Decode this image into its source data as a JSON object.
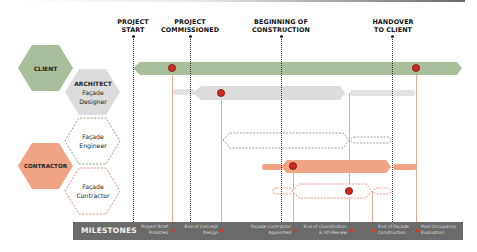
{
  "diagram": {
    "type": "stakeholder-timeline",
    "colors": {
      "client": "#a9bf9c",
      "architect": "#dcdcdc",
      "contractor": "#f0a483",
      "engineer_outline": "#6f8a5f",
      "contractor_outline": "#e36e4f",
      "milestone_bar": "#6b6b6b",
      "milestone_dot": "#cc2a1f",
      "guide_line": "#e9a99a"
    },
    "phase_markers": [
      {
        "id": "project-start",
        "line1": "PROJECT",
        "line2": "START"
      },
      {
        "id": "project-commissioned",
        "line1": "PROJECT",
        "line2": "COMMISSIONED"
      },
      {
        "id": "beginning-construction",
        "line1": "BEGINNING OF",
        "line2": "CONSTRUCTION"
      },
      {
        "id": "handover",
        "line1": "HANDOVER",
        "line2": "TO CLIENT"
      }
    ],
    "actors": [
      {
        "id": "client",
        "line1": "CLIENT"
      },
      {
        "id": "architect",
        "line1": "ARCHITECT",
        "line2": "Façade",
        "line3": "Designer"
      },
      {
        "id": "facade-engineer",
        "line1": "Façade",
        "line2": "Engineer"
      },
      {
        "id": "contractor",
        "line1": "CONTRACTOR"
      },
      {
        "id": "facade-contractor",
        "line1": "Façade",
        "line2": "Contractor"
      }
    ],
    "milestones": {
      "title": "MILESTONES",
      "items": [
        {
          "line1": "Project Brief",
          "line2": "Finalized"
        },
        {
          "line1": "End of Concept",
          "line2": "Design"
        },
        {
          "line1": "Façade Contractor",
          "line2": "Appointed"
        },
        {
          "line1": "End of Coordination",
          "line2": "& SD Review"
        },
        {
          "line1": "End of Façade",
          "line2": "Construction"
        },
        {
          "line1": "Post Occupancy",
          "line2": "Evaluation"
        }
      ]
    }
  }
}
